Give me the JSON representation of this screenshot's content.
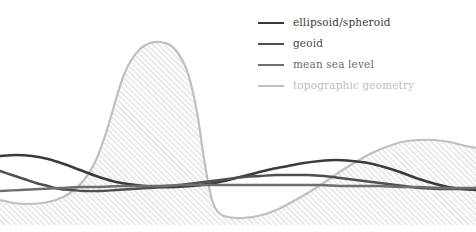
{
  "figure": {
    "title": "",
    "background_color": "#ffffff",
    "width": 476,
    "height": 232
  },
  "legend": {
    "position": "top-right",
    "entries": [
      {
        "label": "ellipsoid/spheroid",
        "color": "#3b3b3b",
        "text_color": "#3b3b3b",
        "line_width": 2.6,
        "icon": "line-swatch-icon"
      },
      {
        "label": "geoid",
        "color": "#4f4f4f",
        "text_color": "#4a4a4a",
        "line_width": 2.4,
        "icon": "line-swatch-icon"
      },
      {
        "label": "mean sea level",
        "color": "#6e6e6e",
        "text_color": "#6a6a6a",
        "line_width": 2.4,
        "icon": "line-swatch-icon"
      },
      {
        "label": "topographic geometry",
        "color": "#c0c0c0",
        "text_color": "#bdbdbd",
        "line_width": 2.2,
        "icon": "line-swatch-icon"
      }
    ]
  },
  "chart_data": {
    "type": "line",
    "title": "",
    "xlabel": "",
    "ylabel": "",
    "xlim": [
      0,
      476
    ],
    "ylim": [
      232,
      0
    ],
    "grid": false,
    "axes_visible": false,
    "tick_labels": [],
    "legend_position": "top-right",
    "annotations": [],
    "fill": {
      "name": "topographic-hatch-fill",
      "pattern": "diagonal-hatch-45",
      "line_color": "#d6d6d6",
      "background": "#fafafa",
      "spacing_px": 4,
      "baseline_y": 225,
      "applies_to_series": "topographic geometry"
    },
    "series": [
      {
        "name": "topographic geometry",
        "color": "#c0c0c0",
        "line_width": 2.2,
        "description": "terrain surface: gentle low plain at left, tall rounded mountain peak near x=155, deep ocean trench between x=210 and x=300, then rising continental shelf toward the right edge",
        "points": [
          [
            0,
            200
          ],
          [
            14,
            203
          ],
          [
            28,
            204
          ],
          [
            42,
            203
          ],
          [
            56,
            200
          ],
          [
            70,
            193
          ],
          [
            84,
            180
          ],
          [
            96,
            160
          ],
          [
            106,
            133
          ],
          [
            114,
            106
          ],
          [
            122,
            80
          ],
          [
            130,
            62
          ],
          [
            140,
            49
          ],
          [
            150,
            43
          ],
          [
            160,
            42
          ],
          [
            170,
            45
          ],
          [
            178,
            53
          ],
          [
            186,
            68
          ],
          [
            192,
            88
          ],
          [
            198,
            118
          ],
          [
            203,
            152
          ],
          [
            208,
            182
          ],
          [
            213,
            203
          ],
          [
            219,
            213
          ],
          [
            228,
            217
          ],
          [
            242,
            218
          ],
          [
            258,
            216
          ],
          [
            274,
            211
          ],
          [
            290,
            203
          ],
          [
            306,
            194
          ],
          [
            322,
            184
          ],
          [
            338,
            173
          ],
          [
            354,
            163
          ],
          [
            370,
            154
          ],
          [
            386,
            147
          ],
          [
            402,
            142
          ],
          [
            418,
            140
          ],
          [
            434,
            140
          ],
          [
            450,
            142
          ],
          [
            462,
            145
          ],
          [
            476,
            148
          ]
        ]
      },
      {
        "name": "ellipsoid/spheroid",
        "color": "#3b3b3b",
        "line_width": 2.6,
        "description": "smooth reference surface: starts high-left near y=155, dips gradually to a broad minimum around x=200, crosses the other curves and rises toward the right before bending down at the far right edge",
        "points": [
          [
            0,
            156
          ],
          [
            16,
            155
          ],
          [
            32,
            156
          ],
          [
            48,
            159
          ],
          [
            64,
            164
          ],
          [
            80,
            170
          ],
          [
            96,
            176
          ],
          [
            112,
            181
          ],
          [
            128,
            184
          ],
          [
            144,
            186
          ],
          [
            160,
            187
          ],
          [
            176,
            187
          ],
          [
            192,
            186
          ],
          [
            208,
            184
          ],
          [
            224,
            181
          ],
          [
            240,
            177
          ],
          [
            256,
            173
          ],
          [
            272,
            169
          ],
          [
            288,
            166
          ],
          [
            304,
            163
          ],
          [
            320,
            161
          ],
          [
            336,
            160
          ],
          [
            352,
            161
          ],
          [
            368,
            163
          ],
          [
            384,
            167
          ],
          [
            400,
            172
          ],
          [
            416,
            178
          ],
          [
            432,
            183
          ],
          [
            448,
            187
          ],
          [
            462,
            189
          ],
          [
            476,
            190
          ]
        ]
      },
      {
        "name": "geoid",
        "color": "#4f4f4f",
        "line_width": 2.4,
        "description": "equipotential surface: begins at y=171 on the left, descends steeply to meet the other curves near x=75, stays low and nearly flat through the middle, then drifts slightly upward to the right edge",
        "points": [
          [
            0,
            171
          ],
          [
            12,
            175
          ],
          [
            24,
            179
          ],
          [
            36,
            183
          ],
          [
            48,
            186
          ],
          [
            60,
            189
          ],
          [
            72,
            190
          ],
          [
            84,
            191
          ],
          [
            100,
            191
          ],
          [
            116,
            190
          ],
          [
            132,
            189
          ],
          [
            148,
            188
          ],
          [
            164,
            187
          ],
          [
            180,
            185
          ],
          [
            196,
            183
          ],
          [
            212,
            181
          ],
          [
            228,
            179
          ],
          [
            244,
            177
          ],
          [
            260,
            176
          ],
          [
            276,
            175
          ],
          [
            292,
            175
          ],
          [
            308,
            175
          ],
          [
            324,
            176
          ],
          [
            340,
            178
          ],
          [
            356,
            180
          ],
          [
            372,
            182
          ],
          [
            388,
            184
          ],
          [
            404,
            186
          ],
          [
            420,
            188
          ],
          [
            440,
            189
          ],
          [
            458,
            189
          ],
          [
            476,
            188
          ]
        ]
      },
      {
        "name": "mean sea level",
        "color": "#6e6e6e",
        "line_width": 2.4,
        "description": "near-horizontal datum: rises slightly from y=190 on the left to a long flat run at about y=185 across the middle and right of the section",
        "points": [
          [
            0,
            191
          ],
          [
            20,
            190
          ],
          [
            40,
            189
          ],
          [
            60,
            188
          ],
          [
            80,
            187
          ],
          [
            100,
            187
          ],
          [
            120,
            186
          ],
          [
            140,
            186
          ],
          [
            160,
            186
          ],
          [
            180,
            185
          ],
          [
            200,
            185
          ],
          [
            220,
            185
          ],
          [
            240,
            185
          ],
          [
            260,
            185
          ],
          [
            280,
            185
          ],
          [
            300,
            185
          ],
          [
            320,
            185
          ],
          [
            340,
            186
          ],
          [
            360,
            186
          ],
          [
            380,
            186
          ],
          [
            400,
            187
          ],
          [
            420,
            187
          ],
          [
            440,
            188
          ],
          [
            458,
            188
          ],
          [
            476,
            188
          ]
        ]
      }
    ]
  }
}
